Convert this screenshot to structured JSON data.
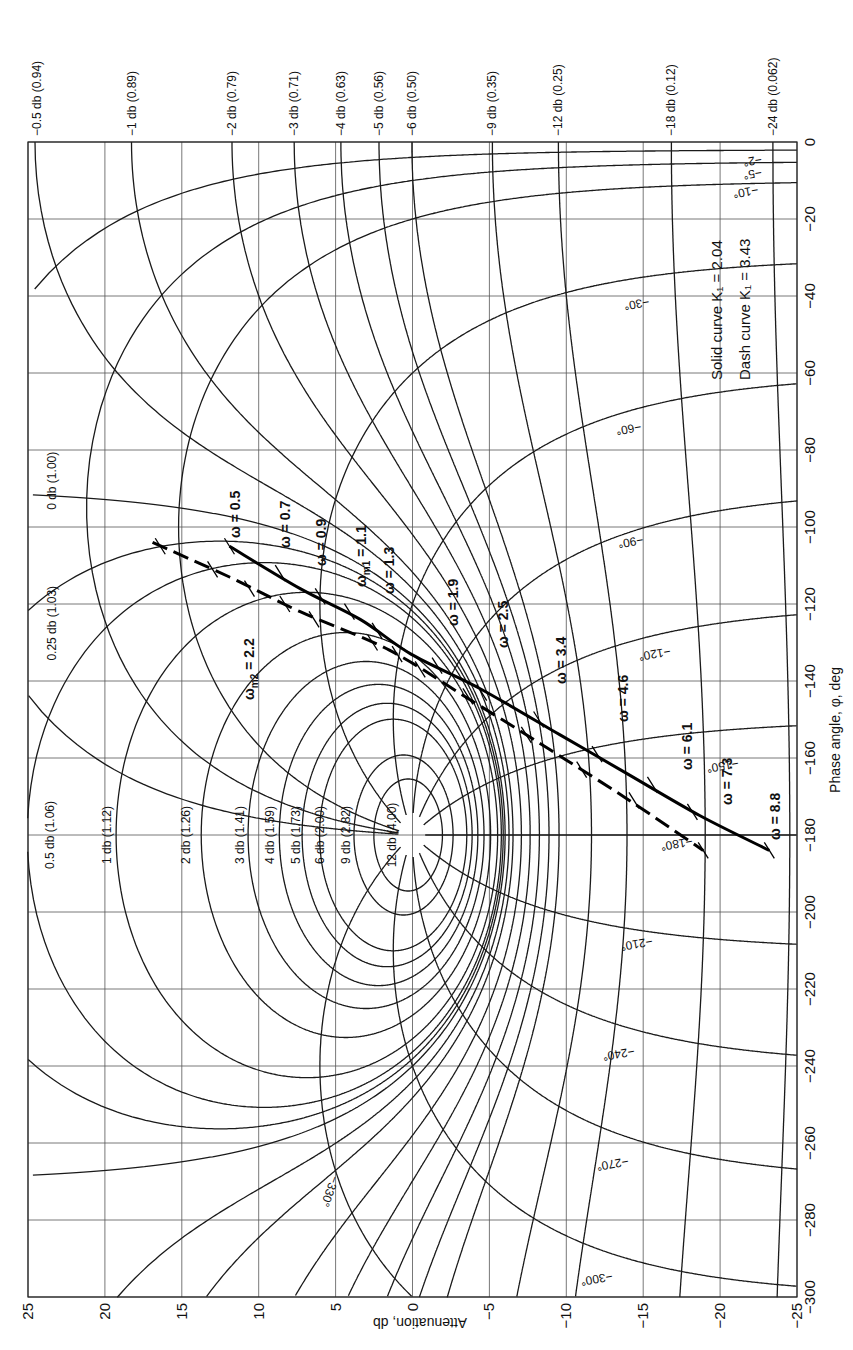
{
  "chart_data": {
    "type": "line",
    "orientation": "rotated 90°: attenuation axis horizontal along bottom, phase axis vertical along right",
    "xlabel": "Attenuation, db",
    "ylabel": "Phase angle, φ, deg",
    "attenuation_axis": {
      "range": [
        25,
        -25
      ],
      "ticks": [
        25,
        20,
        15,
        10,
        5,
        0,
        -5,
        -10,
        -15,
        -20,
        -25
      ],
      "tick_labels": [
        "25",
        "20",
        "15",
        "10",
        "5",
        "0",
        "−5",
        "−10",
        "−15",
        "−20",
        "−25"
      ]
    },
    "phase_axis": {
      "range": [
        0,
        -300
      ],
      "ticks": [
        0,
        -20,
        -40,
        -60,
        -80,
        -100,
        -120,
        -140,
        -160,
        -180,
        -200,
        -220,
        -240,
        -260,
        -280,
        -300
      ],
      "tick_labels": [
        "0",
        "−20",
        "−40",
        "−60",
        "−80",
        "−100",
        "−120",
        "−140",
        "−160",
        "−180",
        "−200",
        "−220",
        "−240",
        "−260",
        "−280",
        "−300"
      ]
    },
    "grid": true,
    "legend": {
      "position": "upper right",
      "entries": [
        {
          "label": "Solid curve",
          "symbol": "K₁ = 2.04",
          "style": "solid"
        },
        {
          "label": "Dash curve",
          "symbol": "K₁ = 3.43",
          "style": "dashed"
        }
      ]
    },
    "m_contours_positive": [
      {
        "db": 0.25,
        "label": "0.25 db (1.03)"
      },
      {
        "db": 0.5,
        "label": "0.5 db (1.06)"
      },
      {
        "db": 1,
        "label": "1 db (1.12)"
      },
      {
        "db": 2,
        "label": "2 db (1.26)"
      },
      {
        "db": 3,
        "label": "3 db (1.41)"
      },
      {
        "db": 4,
        "label": "4 db (1.59)"
      },
      {
        "db": 5,
        "label": "5 db (1.73)"
      },
      {
        "db": 6,
        "label": "6 db (2.00)"
      },
      {
        "db": 9,
        "label": "9 db (2.82)"
      },
      {
        "db": 12,
        "label": "12 db (4.00)"
      }
    ],
    "m_contour_zero": {
      "db": 0,
      "label": "0 db (1.00)"
    },
    "m_contours_negative": [
      {
        "db": -0.5,
        "label": "−0.5 db (0.94)"
      },
      {
        "db": -1,
        "label": "−1 db (0.89)"
      },
      {
        "db": -2,
        "label": "−2 db (0.79)"
      },
      {
        "db": -3,
        "label": "−3 db (0.71)"
      },
      {
        "db": -4,
        "label": "−4 db (0.63)"
      },
      {
        "db": -5,
        "label": "−5 db (0.56)"
      },
      {
        "db": -6,
        "label": "−6 db (0.50)"
      },
      {
        "db": -9,
        "label": "−9 db (0.35)"
      },
      {
        "db": -12,
        "label": "−12 db (0.25)"
      },
      {
        "db": -18,
        "label": "−18 db (0.12)"
      },
      {
        "db": -24,
        "label": "−24 db (0.062)"
      }
    ],
    "n_contours": [
      {
        "deg": -2,
        "label": "−2°"
      },
      {
        "deg": -5,
        "label": "−5°"
      },
      {
        "deg": -10,
        "label": "−10°"
      },
      {
        "deg": -30,
        "label": "−30°"
      },
      {
        "deg": -60,
        "label": "−60°"
      },
      {
        "deg": -90,
        "label": "−90°"
      },
      {
        "deg": -120,
        "label": "−120°"
      },
      {
        "deg": -150,
        "label": "−150°"
      },
      {
        "deg": -180,
        "label": "−180°"
      },
      {
        "deg": -210,
        "label": "−210°"
      },
      {
        "deg": -240,
        "label": "−240°"
      },
      {
        "deg": -270,
        "label": "−270°"
      },
      {
        "deg": -300,
        "label": "−300°"
      },
      {
        "deg": -330,
        "label": "−330°"
      }
    ],
    "series": [
      {
        "name": "Solid curve K1 = 2.04",
        "style": "solid",
        "points_db_deg": [
          [
            11.9,
            -105
          ],
          [
            7.3,
            -116
          ],
          [
            3.4,
            -124
          ],
          [
            0.1,
            -133
          ],
          [
            -4.4,
            -142
          ],
          [
            -9.6,
            -154
          ],
          [
            -13.5,
            -163
          ],
          [
            -18.7,
            -175
          ],
          [
            -23.2,
            -184
          ]
        ],
        "omega_marks": [
          {
            "omega": "0.5",
            "db": 11.9,
            "deg": -105
          },
          {
            "omega": "0.7",
            "db": 8.6,
            "deg": -112
          },
          {
            "omega": "0.9",
            "db": 6.0,
            "deg": -118
          },
          {
            "omega": "ω_m1 = 1.1",
            "db": 4.1,
            "deg": -122
          },
          {
            "omega": "1.3",
            "db": 2.3,
            "deg": -127
          },
          {
            "omega": "1.9",
            "db": -1.6,
            "deg": -136
          },
          {
            "omega": "2.5",
            "db": -4.5,
            "deg": -143
          },
          {
            "omega": "3.4",
            "db": -8.2,
            "deg": -150
          },
          {
            "omega": "4.6",
            "db": -12.0,
            "deg": -159
          },
          {
            "omega": "6.1",
            "db": -15.6,
            "deg": -167
          },
          {
            "omega": "7.3",
            "db": -18.2,
            "deg": -174
          },
          {
            "omega": "8.8",
            "db": -23.2,
            "deg": -184
          }
        ]
      },
      {
        "name": "Dash curve K1 = 3.43",
        "style": "dashed",
        "points_db_deg": [
          [
            16.9,
            -104
          ],
          [
            11.9,
            -113
          ],
          [
            7.3,
            -122
          ],
          [
            1.5,
            -132
          ],
          [
            -3.8,
            -145
          ],
          [
            -9.0,
            -158
          ],
          [
            -14.1,
            -171
          ],
          [
            -18.9,
            -184
          ]
        ],
        "omega_marks": [
          {
            "omega": "0.5",
            "db": 16.4,
            "deg": -105
          },
          {
            "omega": "0.7",
            "db": 13.0,
            "deg": -111
          },
          {
            "omega": "0.9",
            "db": 10.6,
            "deg": -116
          },
          {
            "omega": "1.1",
            "db": 8.3,
            "deg": -120
          },
          {
            "omega": "1.3",
            "db": 6.4,
            "deg": -124
          },
          {
            "omega": "1.9",
            "db": 2.6,
            "deg": -130
          },
          {
            "omega": "ω_m2 = 2.2",
            "db": 1.0,
            "deg": -133
          },
          {
            "omega": "2.5",
            "db": -0.5,
            "deg": -137
          },
          {
            "omega": "3.4",
            "db": -3.6,
            "deg": -144
          },
          {
            "omega": "4.6",
            "db": -7.4,
            "deg": -154
          },
          {
            "omega": "6.1",
            "db": -11.0,
            "deg": -163
          },
          {
            "omega": "7.3",
            "db": -14.4,
            "deg": -171
          },
          {
            "omega": "8.8",
            "db": -18.9,
            "deg": -184
          }
        ]
      }
    ],
    "omega_labels": [
      {
        "text": "ω = 0.5"
      },
      {
        "text": "ω = 0.7"
      },
      {
        "text": "ω = 0.9"
      },
      {
        "text": "ω_m1 = 1.1"
      },
      {
        "text": "ω = 1.3"
      },
      {
        "text": "ω = 1.9"
      },
      {
        "text": "ω = 2.5"
      },
      {
        "text": "ω = 3.4"
      },
      {
        "text": "ω = 4.6"
      },
      {
        "text": "ω = 6.1"
      },
      {
        "text": "ω = 7.3"
      },
      {
        "text": "ω = 8.8"
      },
      {
        "text": "ω_m2 = 2.2"
      }
    ]
  },
  "labels": {
    "xlabel": "Attenuation, db",
    "ylabel": "Phase angle, φ, deg",
    "legend_solid": "Solid curve  K₁ = 2.04",
    "legend_dash": "Dash curve  K₁ = 3.43",
    "w05": "ω = 0.5",
    "w07": "ω = 0.7",
    "w09": "ω = 0.9",
    "wm1_prefix": "ω",
    "wm1_sub": "m1",
    "wm1_val": " = 1.1",
    "w13": "ω = 1.3",
    "w19": "ω = 1.9",
    "w25": "ω = 2.5",
    "w34": "ω = 3.4",
    "w46": "ω = 4.6",
    "w61": "ω = 6.1",
    "w73": "ω = 7.3",
    "w88": "ω = 8.8",
    "wm2_prefix": "ω",
    "wm2_sub": "m2",
    "wm2_val": " = 2.2"
  }
}
